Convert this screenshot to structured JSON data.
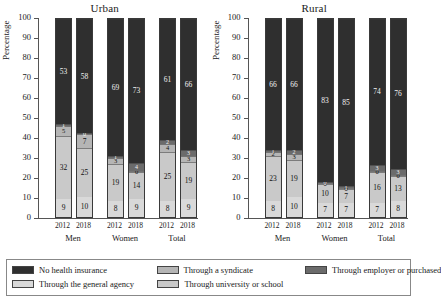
{
  "chart_data": {
    "type": "bar",
    "subtype": "stacked-bar-100",
    "title": "",
    "ylabel": "Percentage",
    "xlabel": "",
    "ylim": [
      0,
      100
    ],
    "yticks": [
      0,
      10,
      20,
      30,
      40,
      50,
      60,
      70,
      80,
      90,
      100
    ],
    "grid": false,
    "legend_position": "bottom",
    "categories": [
      "2012",
      "2018",
      "2012",
      "2018",
      "2012",
      "2018"
    ],
    "groups": [
      "Men",
      "Women",
      "Total"
    ],
    "series_names": [
      "Through the general agency",
      "Through university or school",
      "Through a syndicate",
      "Through employer or purchased",
      "No health insurance"
    ],
    "panels": [
      {
        "name": "Urban",
        "bars": [
          {
            "year": "2012",
            "group": "Men",
            "values": [
              9,
              32,
              5,
              1,
              53
            ]
          },
          {
            "year": "2018",
            "group": "Men",
            "values": [
              10,
              25,
              7,
              0,
              58
            ]
          },
          {
            "year": "2012",
            "group": "Women",
            "values": [
              8,
              19,
              3,
              1,
              69
            ]
          },
          {
            "year": "2018",
            "group": "Women",
            "values": [
              9,
              14,
              0,
              4,
              73
            ]
          },
          {
            "year": "2012",
            "group": "Total",
            "values": [
              8,
              25,
              4,
              2,
              61
            ]
          },
          {
            "year": "2018",
            "group": "Total",
            "values": [
              9,
              19,
              3,
              3,
              66
            ]
          }
        ]
      },
      {
        "name": "Rural",
        "bars": [
          {
            "year": "2012",
            "group": "Men",
            "values": [
              8,
              23,
              2,
              1,
              66
            ]
          },
          {
            "year": "2018",
            "group": "Men",
            "values": [
              10,
              19,
              3,
              2,
              66
            ]
          },
          {
            "year": "2012",
            "group": "Women",
            "values": [
              7,
              10,
              0,
              0,
              83
            ]
          },
          {
            "year": "2018",
            "group": "Women",
            "values": [
              7,
              7,
              0,
              1,
              85
            ]
          },
          {
            "year": "2012",
            "group": "Total",
            "values": [
              7,
              16,
              0,
              3,
              74
            ]
          },
          {
            "year": "2018",
            "group": "Total",
            "values": [
              8,
              13,
              0,
              3,
              76
            ]
          }
        ]
      }
    ],
    "colors": {
      "no_health_insurance": "#2f2f2f",
      "general_agency": "#d9d9d9",
      "syndicate": "#b5b5b5",
      "university_or_school": "#c9c9c9",
      "employer_or_purchased": "#6b6b6b"
    }
  },
  "panels": [
    {
      "title": "Urban",
      "ylabel": "Percentage"
    },
    {
      "title": "Rural",
      "ylabel": "Percentage"
    }
  ],
  "axis": {
    "yticks": [
      "0",
      "10",
      "20",
      "30",
      "40",
      "50",
      "60",
      "70",
      "80",
      "90",
      "100"
    ],
    "group_labels": [
      "Men",
      "Women",
      "Total"
    ],
    "year_labels": [
      "2012",
      "2018"
    ]
  },
  "legend": {
    "items": [
      {
        "label": "No health insurance",
        "color": "#2f2f2f"
      },
      {
        "label": "Through a syndicate",
        "color": "#b5b5b5"
      },
      {
        "label": "Through employer or purchased",
        "color": "#6b6b6b"
      },
      {
        "label": "Through the general agency",
        "color": "#d9d9d9"
      },
      {
        "label": "Through university or school",
        "color": "#c9c9c9"
      }
    ]
  }
}
